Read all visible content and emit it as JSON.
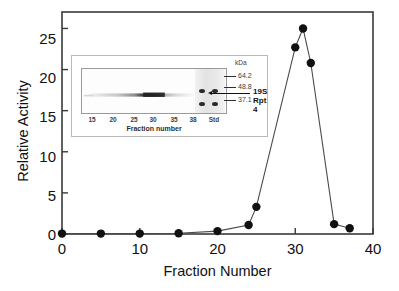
{
  "chart_data": {
    "type": "line",
    "title": "",
    "xlabel": "Fraction Number",
    "ylabel": "Relative Activity",
    "xlim": [
      0,
      40
    ],
    "ylim": [
      0,
      27
    ],
    "xticks": [
      0,
      10,
      20,
      30,
      40
    ],
    "yticks": [
      0,
      5,
      10,
      15,
      20,
      25
    ],
    "grid": false,
    "legend": "none",
    "marker": "filled-circle",
    "series": [
      {
        "name": "Relative Activity",
        "x": [
          0,
          5,
          10,
          15,
          20,
          24,
          25,
          30,
          31,
          32,
          35,
          37
        ],
        "y": [
          0.05,
          0.05,
          0.05,
          0.1,
          0.35,
          1.1,
          3.3,
          22.7,
          25.0,
          20.8,
          1.2,
          0.7
        ]
      }
    ]
  },
  "axes": {
    "x_title": "Fraction Number",
    "y_title": "Relative Activity",
    "x_tick_labels": [
      "0",
      "10",
      "20",
      "30",
      "40"
    ],
    "y_tick_labels": [
      "0",
      "5",
      "10",
      "15",
      "20",
      "25"
    ]
  },
  "inset": {
    "gel_x_title": "Fraction number",
    "gel_tick_labels": [
      "15",
      "20",
      "25",
      "30",
      "35",
      "38",
      "Std"
    ],
    "kda_caption": "kDa",
    "markers": [
      "64.2",
      "48.8",
      "37.1"
    ],
    "annotation_19s": "19S",
    "annotation_rpt4": "Rpt 4"
  },
  "colors": {
    "axis": "#3a3a3a",
    "marker": "#111111",
    "line": "#4a4a4a",
    "text": "#111111"
  }
}
